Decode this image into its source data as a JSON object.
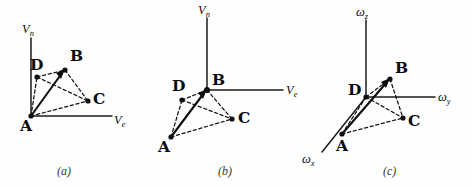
{
  "figure": {
    "ink_color": "#0d0d0d",
    "background_color": "#fefefe"
  },
  "panels": [
    {
      "id": "panel-a",
      "caption": "(a)",
      "frame": "navigation-velocity",
      "origin_vertex": "A",
      "axes": [
        {
          "name": "vertical-axis",
          "base": "V",
          "sub": "n"
        },
        {
          "name": "horizontal-axis",
          "base": "V",
          "sub": "e"
        }
      ],
      "vertices": [
        {
          "label": "A"
        },
        {
          "label": "B"
        },
        {
          "label": "C"
        },
        {
          "label": "D"
        }
      ],
      "solid_vector": "A to B"
    },
    {
      "id": "panel-b",
      "caption": "(b)",
      "frame": "navigation-velocity",
      "origin_vertex": "B",
      "axes": [
        {
          "name": "vertical-axis",
          "base": "V",
          "sub": "n"
        },
        {
          "name": "horizontal-axis",
          "base": "V",
          "sub": "e"
        }
      ],
      "vertices": [
        {
          "label": "A"
        },
        {
          "label": "B"
        },
        {
          "label": "C"
        },
        {
          "label": "D"
        }
      ],
      "solid_vector": "A to B"
    },
    {
      "id": "panel-c",
      "caption": "(c)",
      "frame": "angular-rate",
      "origin_vertex": "D",
      "axes": [
        {
          "name": "vertical-axis",
          "base": "ω",
          "sub": "z"
        },
        {
          "name": "horizontal-axis",
          "base": "ω",
          "sub": "y"
        },
        {
          "name": "oblique-axis",
          "base": "ω",
          "sub": "x"
        }
      ],
      "vertices": [
        {
          "label": "A"
        },
        {
          "label": "B"
        },
        {
          "label": "C"
        },
        {
          "label": "D"
        }
      ],
      "solid_vector": "A to B"
    }
  ]
}
